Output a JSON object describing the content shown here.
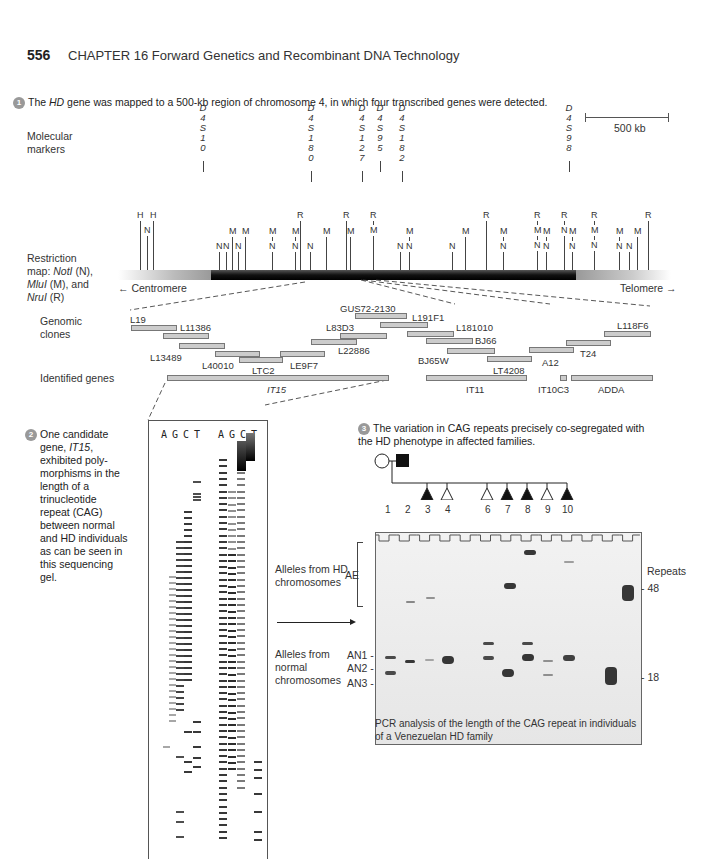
{
  "header": {
    "page_number": "556",
    "chapter": "CHAPTER 16 Forward Genetics and Recombinant DNA Technology"
  },
  "step1": {
    "number": "1",
    "text_pre": "The ",
    "text_gene": "HD",
    "text_post": " gene was mapped to a 500-kb region of chromosome 4, in which four transcribed genes were detected.",
    "scale_bar": "500 kb"
  },
  "molecular_markers": {
    "label": "Molecular markers",
    "markers": [
      {
        "name": "D4S10",
        "x": 203
      },
      {
        "name": "D4S180",
        "x": 311
      },
      {
        "name": "D4S127",
        "x": 362
      },
      {
        "name": "D4S95",
        "x": 380
      },
      {
        "name": "D4S182",
        "x": 402
      },
      {
        "name": "D4S98",
        "x": 569
      }
    ]
  },
  "restriction_map": {
    "label_lines": [
      "Restriction",
      "map: NotI (N),",
      "MluI (M), and",
      "NruI (R)"
    ],
    "centromere": "Centromere",
    "telomere": "Telomere",
    "sites": [
      {
        "x": 140,
        "labels": [
          "H"
        ]
      },
      {
        "x": 147,
        "labels": [
          "N"
        ]
      },
      {
        "x": 153,
        "labels": [
          "H"
        ]
      },
      {
        "x": 219,
        "labels": [
          "N"
        ]
      },
      {
        "x": 226,
        "labels": [
          "N"
        ]
      },
      {
        "x": 232,
        "labels": [
          "M"
        ]
      },
      {
        "x": 238,
        "labels": [
          "N"
        ]
      },
      {
        "x": 245,
        "labels": [
          "M"
        ]
      },
      {
        "x": 272,
        "labels": [
          "M",
          "N"
        ]
      },
      {
        "x": 295,
        "labels": [
          "M",
          "N"
        ]
      },
      {
        "x": 300,
        "labels": [
          "R"
        ]
      },
      {
        "x": 310,
        "labels": [
          "N"
        ]
      },
      {
        "x": 326,
        "labels": [
          "M"
        ]
      },
      {
        "x": 346,
        "labels": [
          "R"
        ]
      },
      {
        "x": 350,
        "labels": [
          "M"
        ]
      },
      {
        "x": 373,
        "labels": [
          "R",
          "M"
        ]
      },
      {
        "x": 400,
        "labels": [
          "N"
        ]
      },
      {
        "x": 409,
        "labels": [
          "M",
          "N"
        ]
      },
      {
        "x": 452,
        "labels": [
          "N"
        ]
      },
      {
        "x": 465,
        "labels": [
          "M"
        ]
      },
      {
        "x": 486,
        "labels": [
          "R"
        ]
      },
      {
        "x": 503,
        "labels": [
          "M",
          "N"
        ]
      },
      {
        "x": 537,
        "labels": [
          "R",
          "M",
          "N"
        ]
      },
      {
        "x": 546,
        "labels": [
          "M",
          "N"
        ]
      },
      {
        "x": 564,
        "labels": [
          "R",
          "N"
        ]
      },
      {
        "x": 572,
        "labels": [
          "M",
          "N"
        ]
      },
      {
        "x": 594,
        "labels": [
          "R",
          "M",
          "N"
        ]
      },
      {
        "x": 619,
        "labels": [
          "M",
          "N"
        ]
      },
      {
        "x": 629,
        "labels": [
          "N"
        ]
      },
      {
        "x": 637,
        "labels": [
          "M"
        ]
      },
      {
        "x": 648,
        "labels": [
          "R"
        ]
      }
    ]
  },
  "genomic_clones": {
    "label": "Genomic clones",
    "clones": [
      {
        "name": "L19",
        "x": 131,
        "y": 325,
        "w": 44,
        "lx": 130,
        "ly": 314
      },
      {
        "name": "L11386",
        "x": 163,
        "y": 333,
        "w": 44,
        "lx": 180,
        "ly": 322
      },
      {
        "name": "L13489",
        "x": 179,
        "y": 343,
        "w": 44,
        "lx": 150,
        "ly": 352
      },
      {
        "name": "L40010",
        "x": 215,
        "y": 351,
        "w": 43,
        "lx": 202,
        "ly": 360
      },
      {
        "name": "LTC2",
        "x": 239,
        "y": 357,
        "w": 42,
        "lx": 252,
        "ly": 365
      },
      {
        "name": "LE9F7",
        "x": 280,
        "y": 351,
        "w": 43,
        "lx": 290,
        "ly": 360
      },
      {
        "name": "L22886",
        "x": 311,
        "y": 339,
        "w": 44,
        "lx": 338,
        "ly": 345
      },
      {
        "name": "L83D3",
        "x": 340,
        "y": 333,
        "w": 45,
        "lx": 326,
        "ly": 322
      },
      {
        "name": "GUS72-2130",
        "x": 355,
        "y": 313,
        "w": 50,
        "lx": 340,
        "ly": 303
      },
      {
        "name": "L191F1",
        "x": 380,
        "y": 322,
        "w": 46,
        "lx": 412,
        "ly": 312
      },
      {
        "name": "L181010",
        "x": 407,
        "y": 331,
        "w": 45,
        "lx": 456,
        "ly": 322
      },
      {
        "name": "BJ66",
        "x": 426,
        "y": 338,
        "w": 45,
        "lx": 475,
        "ly": 335
      },
      {
        "name": "BJ65W",
        "x": 447,
        "y": 348,
        "w": 46,
        "lx": 418,
        "ly": 355
      },
      {
        "name": "LT4208",
        "x": 487,
        "y": 356,
        "w": 43,
        "lx": 493,
        "ly": 365
      },
      {
        "name": "A12",
        "x": 529,
        "y": 347,
        "w": 43,
        "lx": 542,
        "ly": 357
      },
      {
        "name": "T24",
        "x": 566,
        "y": 340,
        "w": 43,
        "lx": 580,
        "ly": 348
      },
      {
        "name": "L118F6",
        "x": 604,
        "y": 331,
        "w": 45,
        "lx": 617,
        "ly": 320
      }
    ]
  },
  "identified_genes": {
    "label": "Identified genes",
    "genes": [
      {
        "name": "IT15",
        "x": 167,
        "w": 220,
        "lx": 267,
        "italic": true
      },
      {
        "name": "IT11",
        "x": 426,
        "w": 99,
        "lx": 466,
        "italic": false
      },
      {
        "name": "IT10C3",
        "x": 560,
        "w": 5,
        "lx": 538,
        "italic": false
      },
      {
        "name": "ADDA",
        "x": 571,
        "w": 80,
        "lx": 598,
        "italic": false
      }
    ]
  },
  "step2": {
    "number": "2",
    "lines": [
      "One candidate",
      "gene, IT15,",
      "exhibited poly-",
      "morphisms in the",
      "length of a",
      "trinucleotide",
      "repeat (CAG)",
      "between normal",
      "and HD individuals",
      "as can be seen in",
      "this sequencing",
      "gel."
    ],
    "lane_labels_left": [
      "A",
      "G",
      "C",
      "T"
    ],
    "lane_labels_right": [
      "A",
      "G",
      "C",
      "T"
    ]
  },
  "step3": {
    "number": "3",
    "text": "The variation in CAG repeats precisely co-segregated with the HD phenotype in affected families.",
    "pedigree": {
      "parents": [
        {
          "id": 1,
          "shape": "circle",
          "affected": false
        },
        {
          "id": 2,
          "shape": "square",
          "affected": true
        }
      ],
      "children": [
        {
          "id": 3,
          "affected": true
        },
        {
          "id": 4,
          "affected": false
        },
        {
          "id": 6,
          "affected": false
        },
        {
          "id": 7,
          "affected": true
        },
        {
          "id": 8,
          "affected": true
        },
        {
          "id": 9,
          "affected": false
        },
        {
          "id": 10,
          "affected": true
        }
      ],
      "lane_numbers": [
        "1",
        "2",
        "3",
        "4",
        "6",
        "7",
        "8",
        "9",
        "10"
      ]
    },
    "gel": {
      "left_labels": {
        "hd_group": [
          "Alleles from HD",
          "chromosomes"
        ],
        "ae": "AE",
        "normal_group": [
          "Alleles from",
          "normal",
          "chromosomes"
        ],
        "an1": "AN1",
        "an2": "AN2",
        "an3": "AN3"
      },
      "right_labels": {
        "repeats": "Repeats",
        "tick_48": "48",
        "tick_18": "18"
      },
      "caption": [
        "PCR analysis of the length of the CAG repeat in individuals",
        "of a Venezuelan HD family"
      ]
    }
  }
}
